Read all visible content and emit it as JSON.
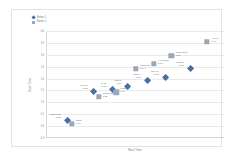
{
  "chart_data": {
    "type": "scatter",
    "title": "",
    "xlabel": "Real Time",
    "ylabel": "Scan Time",
    "xlim": [
      0,
      10
    ],
    "ylim": [
      -0.5,
      4.0
    ],
    "grid": true,
    "legend_position": "top-left",
    "yticks": [
      "4.0",
      "3.5",
      "3.0",
      "2.5",
      "2.0",
      "1.5",
      "1.0",
      "0.5",
      "0.0",
      "-0.5"
    ],
    "ytick_values": [
      4.0,
      3.5,
      3.0,
      2.5,
      2.0,
      1.5,
      1.0,
      0.5,
      0.0,
      -0.5
    ],
    "series": [
      {
        "name": "Series 1",
        "marker": "diamond",
        "color": "#4a6fa5",
        "points": [
          {
            "label": "Nano SIM",
            "value": "0.32",
            "x": 1.05,
            "y": 0.35
          },
          {
            "label": "Teen 5",
            "value": "1.55",
            "x": 2.55,
            "y": 1.55
          },
          {
            "label": "M 75",
            "value": "1.62",
            "x": 3.6,
            "y": 1.66
          },
          {
            "label": "Vista 5",
            "value": "1.75",
            "x": 4.45,
            "y": 1.78
          },
          {
            "label": "Trans 7",
            "value": "2.05",
            "x": 5.55,
            "y": 2.04
          },
          {
            "label": "Mac 97",
            "value": "2.15",
            "x": 6.55,
            "y": 2.14
          },
          {
            "label": "Saturn",
            "value": "2.55",
            "x": 7.95,
            "y": 2.52
          }
        ]
      },
      {
        "name": "Series 2",
        "marker": "square",
        "color": "#9aa7b4",
        "points": [
          {
            "label": "Nano",
            "value": "0.07",
            "x": 1.45,
            "y": 0.1
          },
          {
            "label": "Trans Majo",
            "value": "1.25",
            "x": 2.95,
            "y": 1.24
          },
          {
            "label": "Trans 2",
            "value": "1.40",
            "x": 3.95,
            "y": 1.42
          },
          {
            "label": "Mess 3.5",
            "value": "2.44",
            "x": 5.05,
            "y": 2.42
          },
          {
            "label": "Avg Mach",
            "value": "2.48",
            "x": 6.05,
            "y": 2.62
          },
          {
            "label": "Macs Seps",
            "value": "3.12",
            "x": 7.05,
            "y": 2.96
          },
          {
            "label": "Avg 97",
            "value": "3.41",
            "x": 9.05,
            "y": 3.55
          }
        ]
      }
    ]
  },
  "legend": {
    "entries": [
      {
        "label": "Series 1"
      },
      {
        "label": "Series 2"
      }
    ]
  }
}
